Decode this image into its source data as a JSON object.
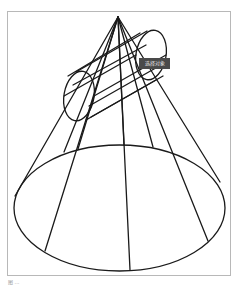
{
  "viewport": {
    "tooltip_label": "选择对象",
    "caption": "图 ..."
  },
  "scene": {
    "apex": [
      118,
      17
    ],
    "base_ellipse": {
      "cx": 119.5,
      "cy": 208,
      "rx": 105.5,
      "ry": 63
    },
    "cylinder": {
      "end_left": {
        "cx": 79,
        "cy": 96,
        "rx": 15,
        "ry": 25,
        "rotate": 10
      },
      "end_right": {
        "cx": 151,
        "cy": 55,
        "rx": 15,
        "ry": 25,
        "rotate": 10
      }
    },
    "edge_color": "#1a1a1a",
    "frame_color": "#b8b8b8",
    "tooltip_bg": "#4a4a4a"
  }
}
